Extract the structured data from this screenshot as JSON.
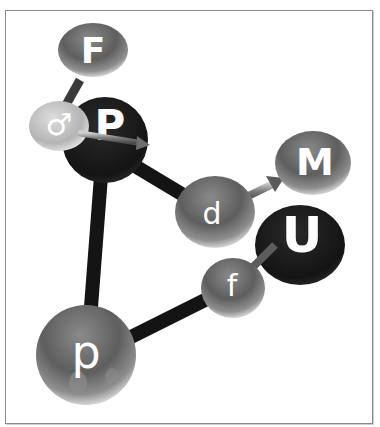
{
  "diagram": {
    "type": "3d-molecule-style-node-graph",
    "nodes": [
      {
        "id": "F",
        "label": "F",
        "shade": "mid"
      },
      {
        "id": "male",
        "label": "♂",
        "shade": "light"
      },
      {
        "id": "P",
        "label": "P",
        "shade": "dark"
      },
      {
        "id": "d",
        "label": "d",
        "shade": "mid"
      },
      {
        "id": "M",
        "label": "M",
        "shade": "mid"
      },
      {
        "id": "U",
        "label": "U",
        "shade": "dark"
      },
      {
        "id": "f",
        "label": "f",
        "shade": "mid"
      },
      {
        "id": "p",
        "label": "p",
        "shade": "mid"
      }
    ],
    "edges": [
      {
        "from": "F",
        "to": "male",
        "style": "thin-gray"
      },
      {
        "from": "male",
        "to": "P",
        "style": "arrow-gray"
      },
      {
        "from": "P",
        "to": "d",
        "style": "thick-black"
      },
      {
        "from": "P",
        "to": "p",
        "style": "thick-black"
      },
      {
        "from": "d",
        "to": "M",
        "style": "arrow-gray"
      },
      {
        "from": "p",
        "to": "f",
        "style": "thick-black"
      },
      {
        "from": "f",
        "to": "U",
        "style": "thin-gray"
      }
    ],
    "colors": {
      "dark_node": "#1a1a1a",
      "mid_node": "#6b6b6b",
      "light_node": "#c8c8c8",
      "edge_black": "#141414",
      "edge_gray": "#7a7a7a",
      "frame": "#8a8a8a"
    }
  }
}
